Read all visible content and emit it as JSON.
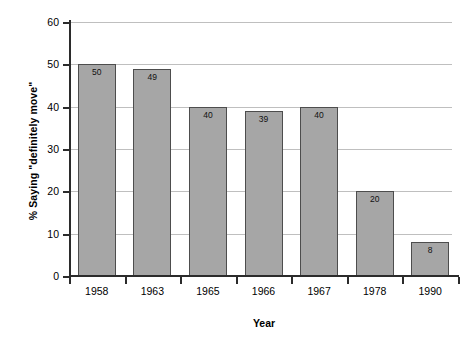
{
  "chart_data": {
    "type": "bar",
    "title": "",
    "subtitle": "",
    "xlabel": "Year",
    "ylabel": "% Saying \"definitely move\"",
    "categories": [
      "1958",
      "1963",
      "1965",
      "1966",
      "1967",
      "1978",
      "1990"
    ],
    "values": [
      50,
      49,
      40,
      39,
      40,
      20,
      8
    ],
    "data_labels": [
      "50",
      "49",
      "40",
      "39",
      "40",
      "20",
      "8"
    ],
    "series": [
      {
        "name": "% Saying \"definitely move\"",
        "values": [
          50,
          49,
          40,
          39,
          40,
          20,
          8
        ]
      }
    ],
    "ylim": [
      0,
      60
    ],
    "y_ticks": [
      60,
      50,
      40,
      30,
      20,
      10,
      0
    ],
    "y_tick_labels": [
      "60",
      "50",
      "40",
      "30",
      "20",
      "10",
      "0"
    ],
    "grid": true,
    "grid_axis": "y",
    "legend": false,
    "legend_position": "none",
    "colors": {
      "bar_fill": "#a6a6a6",
      "bar_border": "#4d4d4d",
      "gridline": "#bfbfbf",
      "axis": "#2b2b2b",
      "text": "#000000",
      "background": "#ffffff"
    },
    "annotations": []
  }
}
